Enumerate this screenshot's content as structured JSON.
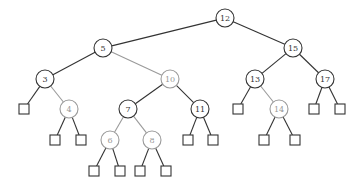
{
  "diagram": {
    "type": "binary-search-tree",
    "colors": {
      "normal": "#333333",
      "highlight": "#9a9a9a"
    },
    "nodes": [
      {
        "id": "n12",
        "label": "12",
        "x": 225,
        "y": 18,
        "gray": false
      },
      {
        "id": "n5",
        "label": "5",
        "x": 103,
        "y": 48,
        "gray": false
      },
      {
        "id": "n15",
        "label": "15",
        "x": 293,
        "y": 48,
        "gray": false
      },
      {
        "id": "n3",
        "label": "3",
        "x": 45,
        "y": 79,
        "gray": false
      },
      {
        "id": "n10",
        "label": "10",
        "x": 170,
        "y": 79,
        "gray": true
      },
      {
        "id": "n13",
        "label": "13",
        "x": 255,
        "y": 79,
        "gray": false
      },
      {
        "id": "n17",
        "label": "17",
        "x": 325,
        "y": 79,
        "gray": false
      },
      {
        "id": "n4",
        "label": "4",
        "x": 69,
        "y": 109,
        "gray": true
      },
      {
        "id": "n7",
        "label": "7",
        "x": 128,
        "y": 109,
        "gray": false
      },
      {
        "id": "n11",
        "label": "11",
        "x": 200,
        "y": 109,
        "gray": false
      },
      {
        "id": "n14",
        "label": "14",
        "x": 279,
        "y": 109,
        "gray": true
      },
      {
        "id": "n6",
        "label": "6",
        "x": 110,
        "y": 140,
        "gray": true
      },
      {
        "id": "n8",
        "label": "8",
        "x": 152,
        "y": 140,
        "gray": true
      }
    ],
    "leaves": [
      {
        "id": "l1",
        "x": 24,
        "y": 109
      },
      {
        "id": "l2",
        "x": 55,
        "y": 140
      },
      {
        "id": "l3",
        "x": 81,
        "y": 140
      },
      {
        "id": "l4",
        "x": 94,
        "y": 171
      },
      {
        "id": "l5",
        "x": 120,
        "y": 171
      },
      {
        "id": "l6",
        "x": 140,
        "y": 171
      },
      {
        "id": "l7",
        "x": 166,
        "y": 171
      },
      {
        "id": "l8",
        "x": 188,
        "y": 140
      },
      {
        "id": "l9",
        "x": 213,
        "y": 140
      },
      {
        "id": "l10",
        "x": 238,
        "y": 109
      },
      {
        "id": "l11",
        "x": 264,
        "y": 140
      },
      {
        "id": "l12",
        "x": 295,
        "y": 140
      },
      {
        "id": "l13",
        "x": 314,
        "y": 109
      },
      {
        "id": "l14",
        "x": 340,
        "y": 109
      }
    ],
    "edges": [
      {
        "from": "n12",
        "to": "n5",
        "gray": false
      },
      {
        "from": "n12",
        "to": "n15",
        "gray": false
      },
      {
        "from": "n5",
        "to": "n3",
        "gray": false
      },
      {
        "from": "n5",
        "to": "n10",
        "gray": true
      },
      {
        "from": "n15",
        "to": "n13",
        "gray": false
      },
      {
        "from": "n15",
        "to": "n17",
        "gray": false
      },
      {
        "from": "n3",
        "to": "l1",
        "gray": false
      },
      {
        "from": "n3",
        "to": "n4",
        "gray": true
      },
      {
        "from": "n10",
        "to": "n7",
        "gray": false
      },
      {
        "from": "n10",
        "to": "n11",
        "gray": false
      },
      {
        "from": "n13",
        "to": "l10",
        "gray": false
      },
      {
        "from": "n13",
        "to": "n14",
        "gray": true
      },
      {
        "from": "n17",
        "to": "l13",
        "gray": false
      },
      {
        "from": "n17",
        "to": "l14",
        "gray": false
      },
      {
        "from": "n4",
        "to": "l2",
        "gray": false
      },
      {
        "from": "n4",
        "to": "l3",
        "gray": false
      },
      {
        "from": "n7",
        "to": "n6",
        "gray": true
      },
      {
        "from": "n7",
        "to": "n8",
        "gray": true
      },
      {
        "from": "n11",
        "to": "l8",
        "gray": false
      },
      {
        "from": "n11",
        "to": "l9",
        "gray": false
      },
      {
        "from": "n14",
        "to": "l11",
        "gray": false
      },
      {
        "from": "n14",
        "to": "l12",
        "gray": false
      },
      {
        "from": "n6",
        "to": "l4",
        "gray": false
      },
      {
        "from": "n6",
        "to": "l5",
        "gray": false
      },
      {
        "from": "n8",
        "to": "l6",
        "gray": false
      },
      {
        "from": "n8",
        "to": "l7",
        "gray": false
      }
    ]
  }
}
